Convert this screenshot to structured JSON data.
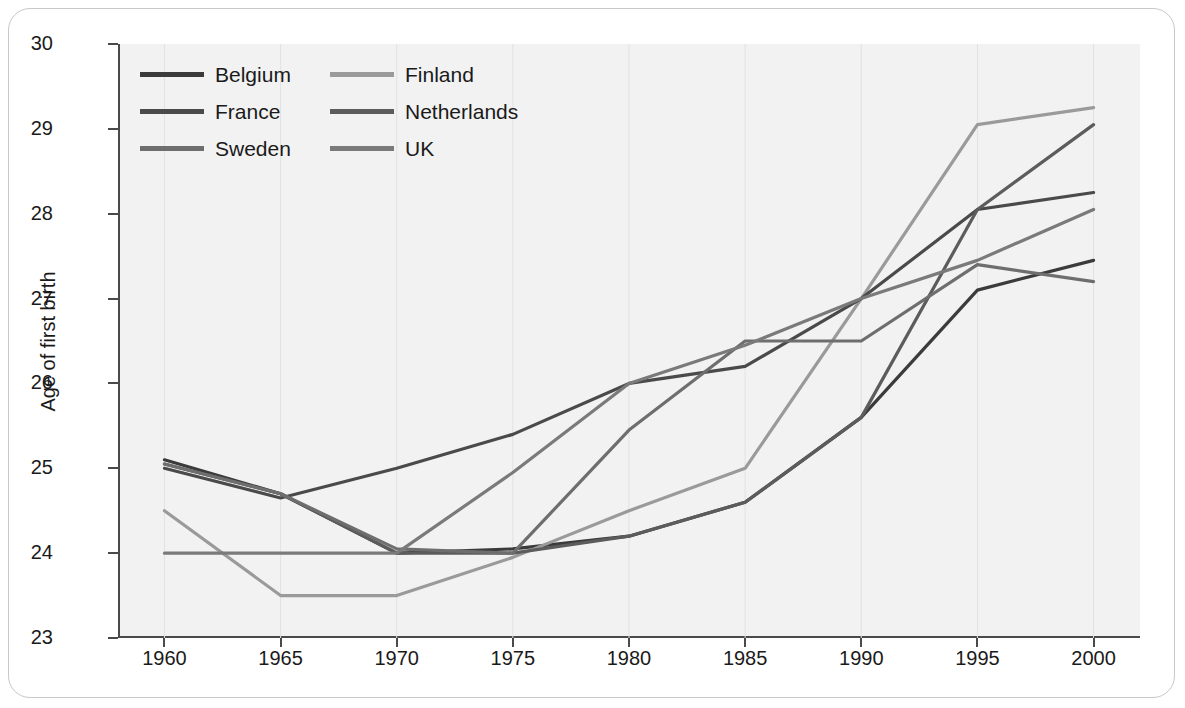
{
  "chart_data": {
    "type": "line",
    "title": "",
    "xlabel": "",
    "ylabel": "Age of first birth",
    "x": [
      1960,
      1965,
      1970,
      1975,
      1980,
      1985,
      1990,
      1995,
      2000
    ],
    "xlim": [
      1958,
      2002
    ],
    "ylim": [
      23,
      30
    ],
    "xticks": [
      "1960",
      "1965",
      "1970",
      "1975",
      "1980",
      "1985",
      "1990",
      "1995",
      "2000"
    ],
    "yticks": [
      "23",
      "24",
      "25",
      "26",
      "27",
      "28",
      "29",
      "30"
    ],
    "grid": true,
    "legend_position": "top-left",
    "series": [
      {
        "name": "Belgium",
        "color": "#3b3b3b",
        "x": [
          1960,
          1965,
          1970,
          1975,
          1980,
          1985,
          1990,
          1995,
          2000
        ],
        "values": [
          25.1,
          24.7,
          24.0,
          24.05,
          24.2,
          24.6,
          25.6,
          27.1,
          27.45
        ]
      },
      {
        "name": "Finland",
        "color": "#9a9a9a",
        "x": [
          1960,
          1965,
          1970,
          1975,
          1980,
          1985,
          1990,
          1995,
          2000
        ],
        "values": [
          24.5,
          23.5,
          23.5,
          23.95,
          24.5,
          25.0,
          27.0,
          29.05,
          29.25
        ]
      },
      {
        "name": "France",
        "color": "#4a4a4a",
        "x": [
          1960,
          1965,
          1970,
          1975,
          1980,
          1985,
          1990,
          1995,
          2000
        ],
        "values": [
          25.0,
          24.65,
          25.0,
          25.4,
          26.0,
          26.2,
          27.0,
          28.05,
          28.25
        ]
      },
      {
        "name": "Netherlands",
        "color": "#5c5c5c",
        "x": [
          1960,
          1965,
          1970,
          1975,
          1980,
          1985,
          1990,
          1995,
          2000
        ],
        "values": [
          25.05,
          24.7,
          24.0,
          24.0,
          24.2,
          24.6,
          25.6,
          28.05,
          29.05
        ]
      },
      {
        "name": "Sweden",
        "color": "#6e6e6e",
        "x": [
          1960,
          1965,
          1970,
          1975,
          1980,
          1985,
          1990,
          1995,
          2000
        ],
        "values": [
          25.05,
          24.7,
          24.05,
          24.0,
          25.45,
          26.5,
          26.5,
          27.4,
          27.2
        ]
      },
      {
        "name": "UK",
        "color": "#7a7a7a",
        "x": [
          1960,
          1965,
          1970,
          1975,
          1980,
          1985,
          1990,
          1995,
          2000
        ],
        "values": [
          24.0,
          24.0,
          24.0,
          24.95,
          26.0,
          26.45,
          27.0,
          27.45,
          28.05
        ]
      }
    ]
  },
  "legend": {
    "entries": [
      {
        "label": "Belgium",
        "color": "#3b3b3b"
      },
      {
        "label": "Finland",
        "color": "#9a9a9a"
      },
      {
        "label": "France",
        "color": "#4a4a4a"
      },
      {
        "label": "Netherlands",
        "color": "#5c5c5c"
      },
      {
        "label": "Sweden",
        "color": "#6e6e6e"
      },
      {
        "label": "UK",
        "color": "#7a7a7a"
      }
    ]
  },
  "axes": {
    "y_title": "Age of first birth"
  },
  "theme": {
    "plot_background": "#f2f2f2",
    "axis_color": "#4a4a4a",
    "grid_color": "#e2e2e2",
    "card_border": "#c8c8c8"
  }
}
